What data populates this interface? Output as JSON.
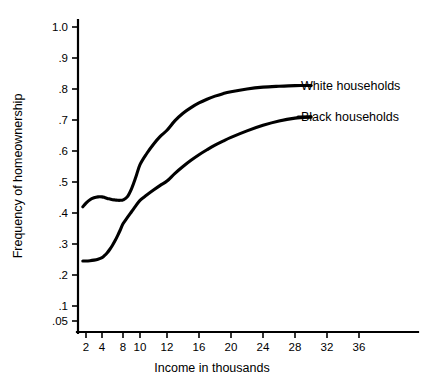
{
  "chart_data": {
    "type": "line",
    "title": "",
    "xlabel": "Income in thousands",
    "ylabel": "Frequency of homeownership",
    "grid": false,
    "legend_position": "right-inline-labels",
    "x_ticks": [
      2,
      4,
      8,
      10,
      12,
      16,
      20,
      24,
      28,
      32,
      36
    ],
    "x_tick_labels": [
      "2",
      "4",
      "8",
      "10",
      "12",
      "16",
      "20",
      "24",
      "28",
      "32",
      "36"
    ],
    "y_ticks": [
      1.0,
      0.9,
      0.8,
      0.7,
      0.6,
      0.5,
      0.4,
      0.3,
      0.2,
      0.1,
      0.05
    ],
    "y_tick_labels": [
      "1.0",
      ".9",
      ".8",
      ".7",
      ".6",
      ".5",
      ".4",
      ".3",
      ".2",
      ".1",
      ".05"
    ],
    "xlim": [
      1.5,
      40
    ],
    "ylim": [
      0.02,
      1.04
    ],
    "series": [
      {
        "name": "White households",
        "color": "#000000",
        "x": [
          1.6,
          2.0,
          2.5,
          3.0,
          3.5,
          4.0,
          4.5,
          5.0,
          5.5,
          6.0,
          6.5,
          7.0,
          7.5,
          8.0,
          8.5,
          9.0,
          9.5,
          10.0,
          10.5,
          11.0,
          11.5,
          12.0,
          13.0,
          14.0,
          15.0,
          16.0,
          17.0,
          18.0,
          19.0,
          20.0,
          22.0,
          24.0,
          26.0,
          28.0,
          30.0
        ],
        "values": [
          0.42,
          0.432,
          0.443,
          0.449,
          0.452,
          0.452,
          0.45,
          0.447,
          0.445,
          0.443,
          0.442,
          0.441,
          0.441,
          0.442,
          0.452,
          0.478,
          0.515,
          0.556,
          0.592,
          0.622,
          0.647,
          0.667,
          0.698,
          0.722,
          0.74,
          0.755,
          0.767,
          0.777,
          0.785,
          0.791,
          0.8,
          0.806,
          0.809,
          0.811,
          0.811
        ]
      },
      {
        "name": "Black households",
        "color": "#000000",
        "x": [
          1.6,
          2.0,
          2.5,
          3.0,
          3.5,
          4.0,
          4.5,
          5.0,
          5.5,
          6.0,
          6.5,
          7.0,
          7.5,
          8.0,
          8.5,
          9.0,
          9.5,
          10.0,
          10.5,
          11.0,
          11.5,
          12.0,
          13.0,
          14.0,
          15.0,
          16.0,
          17.0,
          18.0,
          19.0,
          20.0,
          22.0,
          24.0,
          26.0,
          28.0,
          30.0
        ],
        "values": [
          0.245,
          0.245,
          0.246,
          0.248,
          0.251,
          0.256,
          0.263,
          0.272,
          0.283,
          0.296,
          0.311,
          0.328,
          0.346,
          0.365,
          0.385,
          0.404,
          0.423,
          0.441,
          0.458,
          0.474,
          0.489,
          0.503,
          0.528,
          0.55,
          0.57,
          0.588,
          0.604,
          0.619,
          0.632,
          0.644,
          0.665,
          0.683,
          0.697,
          0.706,
          0.71
        ]
      }
    ]
  },
  "labels": {
    "white_households": "White households",
    "black_households": "Black households"
  }
}
